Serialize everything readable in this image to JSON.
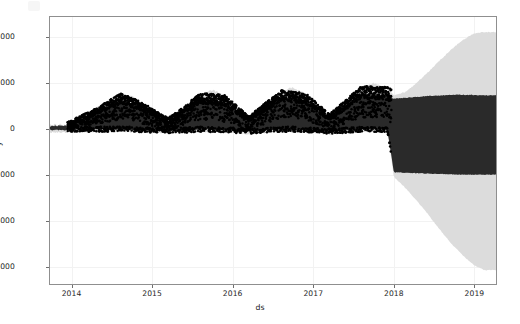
{
  "chart_data": {
    "type": "area",
    "title": "",
    "xlabel": "ds",
    "ylabel": "y",
    "xlim": [
      "2013-09",
      "2019-03"
    ],
    "ylim": [
      -6800,
      4900
    ],
    "grid": true,
    "legend": "none",
    "xticks": [
      "2014",
      "2015",
      "2016",
      "2017",
      "2018",
      "2019"
    ],
    "yticks": [
      "4000",
      "2000",
      "0",
      "-2000",
      "-4000",
      "-6000"
    ],
    "ytick_values": [
      4000,
      2000,
      0,
      -2000,
      -4000,
      -6000
    ],
    "colors": {
      "observed_points": "#000000",
      "forecast_band": "#2a2a2a",
      "uncertainty_band": "#dcdcdc",
      "gridline": "#f2f2f2",
      "axis": "#8f8f8f",
      "text": "#262626",
      "background": "#ffffff"
    },
    "series": [
      {
        "name": "yhat_upper_outer",
        "x": [
          2013.95,
          2014.1,
          2014.3,
          2014.5,
          2014.62,
          2014.75,
          2014.9,
          2015.05,
          2015.2,
          2015.4,
          2015.6,
          2015.75,
          2015.9,
          2016.05,
          2016.2,
          2016.4,
          2016.6,
          2016.75,
          2016.9,
          2017.05,
          2017.2,
          2017.4,
          2017.6,
          2017.75,
          2017.92,
          2018.0,
          2018.15,
          2018.35,
          2018.55,
          2018.7,
          2018.85,
          2019.0,
          2019.12
        ],
        "values": [
          180,
          430,
          900,
          1350,
          1500,
          1420,
          1050,
          600,
          420,
          900,
          1500,
          1700,
          1400,
          800,
          520,
          1000,
          1600,
          1800,
          1500,
          900,
          620,
          1150,
          1750,
          2000,
          1700,
          1450,
          1600,
          2200,
          2900,
          3400,
          3850,
          4150,
          4200
        ]
      },
      {
        "name": "yhat_upper",
        "x": [
          2013.95,
          2014.3,
          2014.62,
          2014.9,
          2015.2,
          2015.6,
          2015.9,
          2016.2,
          2016.6,
          2016.9,
          2017.2,
          2017.6,
          2017.92,
          2018.0,
          2018.4,
          2018.8,
          2019.12
        ],
        "values": [
          120,
          700,
          1250,
          850,
          300,
          1250,
          1150,
          380,
          1350,
          1250,
          450,
          1500,
          1450,
          1300,
          1420,
          1480,
          1450
        ]
      },
      {
        "name": "yhat",
        "x": [
          2013.95,
          2014.3,
          2014.62,
          2014.9,
          2015.2,
          2015.6,
          2015.9,
          2016.2,
          2016.6,
          2016.9,
          2017.2,
          2017.6,
          2017.92,
          2018.0,
          2018.4,
          2018.8,
          2019.12
        ],
        "values": [
          30,
          380,
          700,
          420,
          60,
          700,
          600,
          90,
          780,
          700,
          120,
          850,
          800,
          300,
          350,
          400,
          380
        ]
      },
      {
        "name": "yhat_lower",
        "x": [
          2013.95,
          2014.3,
          2014.62,
          2014.9,
          2015.2,
          2015.6,
          2015.9,
          2016.2,
          2016.6,
          2016.9,
          2017.2,
          2017.6,
          2017.92,
          2018.0,
          2018.4,
          2018.8,
          2019.12
        ],
        "values": [
          -60,
          -40,
          -30,
          -60,
          -100,
          -40,
          -60,
          -120,
          -30,
          -50,
          -130,
          -30,
          -60,
          -1900,
          -1950,
          -2000,
          -2000
        ]
      },
      {
        "name": "yhat_lower_outer",
        "x": [
          2013.95,
          2014.3,
          2014.62,
          2014.9,
          2015.2,
          2015.6,
          2015.9,
          2016.2,
          2016.6,
          2016.9,
          2017.2,
          2017.6,
          2017.92,
          2018.0,
          2018.15,
          2018.35,
          2018.55,
          2018.7,
          2018.85,
          2019.0,
          2019.12
        ],
        "values": [
          -160,
          -150,
          -140,
          -170,
          -220,
          -150,
          -170,
          -240,
          -140,
          -160,
          -250,
          -140,
          -180,
          -2100,
          -2600,
          -3400,
          -4300,
          -4950,
          -5500,
          -5950,
          -6150
        ]
      }
    ],
    "observed": {
      "name": "y (observed)",
      "description": "dense black scatter of historical observations, Jan 2014 through Dec 2017",
      "x_range": [
        "2013.95",
        "2017.95"
      ],
      "y_range": [
        -300,
        2200
      ]
    },
    "annotations": [
      "forecast uncertainty widens sharply after 2018",
      "strong annual seasonality with summer peaks near 1500-2000"
    ]
  },
  "axis": {
    "ylabel": "y",
    "xlabel": "ds",
    "yticks": [
      {
        "label": "4000"
      },
      {
        "label": "2000"
      },
      {
        "label": "0"
      },
      {
        "label": "−2000"
      },
      {
        "label": "−4000"
      },
      {
        "label": "−6000"
      }
    ],
    "xticks": [
      {
        "label": "2014"
      },
      {
        "label": "2015"
      },
      {
        "label": "2016"
      },
      {
        "label": "2017"
      },
      {
        "label": "2018"
      },
      {
        "label": "2019"
      }
    ]
  }
}
